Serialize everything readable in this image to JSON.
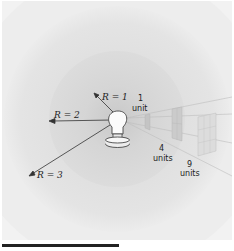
{
  "figure": {
    "labels": {
      "r1": "R = 1",
      "r2": "R = 2",
      "r3": "R = 3",
      "area1_value": "1",
      "area1_unit": "unit",
      "area4_value": "4",
      "area4_unit": "units",
      "area9_value": "9",
      "area9_unit": "units"
    },
    "colors": {
      "background": "#f2f2f2",
      "outer_sphere": "#e2e2e2",
      "middle_sphere": "#d9d9d9",
      "inner_sphere": "#d2d2d2",
      "ink": "#222222"
    },
    "icons": [
      "light-bulb-icon"
    ]
  }
}
